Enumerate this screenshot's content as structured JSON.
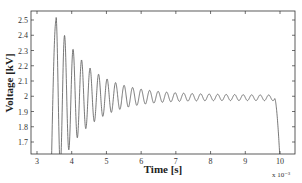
{
  "chart_data": {
    "type": "line",
    "title": "",
    "xlabel": "Time [s]",
    "ylabel": "Voltage [kV]",
    "x_multiplier": "x 10⁻³",
    "xlim": [
      2.85,
      10.4
    ],
    "ylim": [
      1.6,
      2.55
    ],
    "xticks": [
      3,
      4,
      5,
      6,
      7,
      8,
      9,
      10
    ],
    "yticks": [
      1.7,
      1.8,
      1.9,
      2.0,
      2.1,
      2.2,
      2.3,
      2.4,
      2.5
    ],
    "ytick_labels": [
      "1.7",
      "1.8",
      "1.9",
      "2",
      "2.1",
      "2.2",
      "2.3",
      "2.4",
      "2.5"
    ],
    "grid": false,
    "legend": null,
    "series": [
      {
        "name": "Voltage",
        "color": "#555555",
        "description": "Damped oscillation: rises from below 1.6 at t≈3.4, peaks 2.5 at t≈3.55, minimum ≈1.65 at t≈3.7, decays toward 2.0 kV with small ripple (±0.02) until t≈9.85, then drops sharply below 1.6 at t≈10",
        "key_points": [
          {
            "x": 3.42,
            "y": 1.6
          },
          {
            "x": 3.55,
            "y": 2.5
          },
          {
            "x": 3.7,
            "y": 1.66
          },
          {
            "x": 3.82,
            "y": 2.25
          },
          {
            "x": 3.94,
            "y": 1.79
          },
          {
            "x": 4.05,
            "y": 2.17
          },
          {
            "x": 4.16,
            "y": 1.84
          },
          {
            "x": 5.0,
            "y": 2.06
          },
          {
            "x": 6.0,
            "y": 2.03
          },
          {
            "x": 7.0,
            "y": 2.02
          },
          {
            "x": 9.7,
            "y": 2.0
          },
          {
            "x": 9.85,
            "y": 1.98
          },
          {
            "x": 10.0,
            "y": 1.6
          }
        ]
      }
    ]
  }
}
